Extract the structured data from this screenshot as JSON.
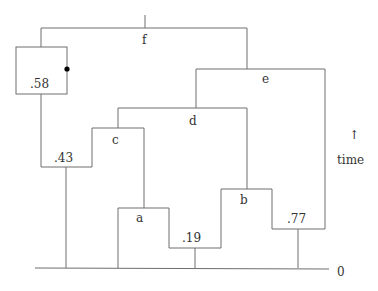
{
  "diagram": {
    "type": "tree-time-diagram",
    "nodes": {
      "f": "f",
      "e": "e",
      "d": "d",
      "c": "c",
      "a": "a",
      "b": "b"
    },
    "values": {
      "v58": ".58",
      "v43": ".43",
      "v19": ".19",
      "v77": ".77"
    },
    "axis": {
      "arrow": "↑",
      "label": "time",
      "zero": "0"
    },
    "colors": {
      "line": "#6e6e6e",
      "text": "#333333",
      "dot": "#000000"
    }
  }
}
